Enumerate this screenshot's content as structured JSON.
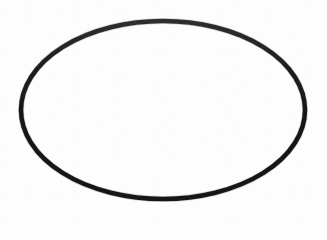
{
  "canvas": {
    "width": 327,
    "height": 240,
    "background_color": "#fdfdfd",
    "description": "Scanned black-ink ellipse outline on blank white paper"
  },
  "figure": {
    "shape_name": "ellipse-outline",
    "shape_type": "ellipse",
    "stroke_color": "#1e1e1e",
    "fill_color": "none",
    "stroke_width": 4.5,
    "center_x": 163,
    "center_y": 110,
    "radius_x": 142,
    "radius_y": 89,
    "bounds": {
      "left": 21,
      "top": 21,
      "right": 305,
      "bottom": 199
    },
    "rotation_degrees": 0,
    "label": ""
  },
  "texture": {
    "name": "paper-grain",
    "opacity": 0.55
  }
}
